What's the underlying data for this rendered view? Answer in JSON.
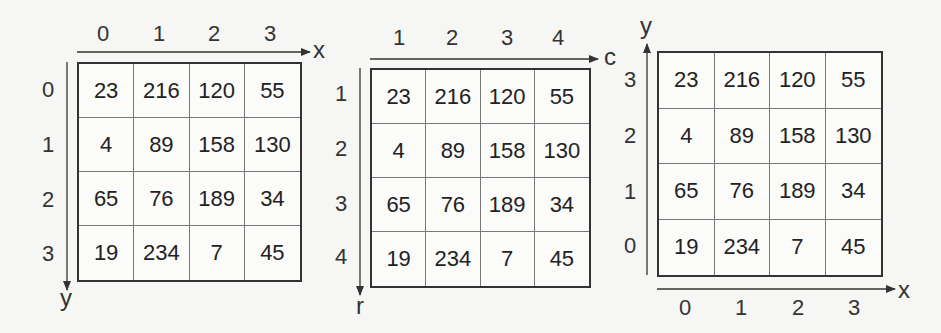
{
  "panels": [
    {
      "id": "image-coords-zero-based",
      "x_axis_label": "x",
      "y_axis_label": "y",
      "col_labels": [
        "0",
        "1",
        "2",
        "3"
      ],
      "row_labels": [
        "0",
        "1",
        "2",
        "3"
      ],
      "cells": [
        [
          "23",
          "216",
          "120",
          "55"
        ],
        [
          "4",
          "89",
          "158",
          "130"
        ],
        [
          "65",
          "76",
          "189",
          "34"
        ],
        [
          "19",
          "234",
          "7",
          "45"
        ]
      ]
    },
    {
      "id": "matrix-coords-one-based",
      "x_axis_label": "c",
      "y_axis_label": "r",
      "col_labels": [
        "1",
        "2",
        "3",
        "4"
      ],
      "row_labels": [
        "1",
        "2",
        "3",
        "4"
      ],
      "cells": [
        [
          "23",
          "216",
          "120",
          "55"
        ],
        [
          "4",
          "89",
          "158",
          "130"
        ],
        [
          "65",
          "76",
          "189",
          "34"
        ],
        [
          "19",
          "234",
          "7",
          "45"
        ]
      ]
    },
    {
      "id": "cartesian-coords",
      "x_axis_label": "x",
      "y_axis_label": "y",
      "col_labels": [
        "0",
        "1",
        "2",
        "3"
      ],
      "row_labels": [
        "3",
        "2",
        "1",
        "0"
      ],
      "cells": [
        [
          "23",
          "216",
          "120",
          "55"
        ],
        [
          "4",
          "89",
          "158",
          "130"
        ],
        [
          "65",
          "76",
          "189",
          "34"
        ],
        [
          "19",
          "234",
          "7",
          "45"
        ]
      ]
    }
  ]
}
